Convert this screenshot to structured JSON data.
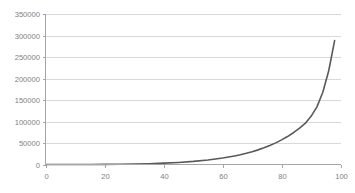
{
  "chart_data": {
    "type": "line",
    "title": "",
    "subtitle": "",
    "xlabel": "",
    "ylabel": "",
    "xlim": [
      0,
      100
    ],
    "ylim": [
      0,
      350000
    ],
    "grid": "horizontal",
    "legend": "none",
    "x_ticks": [
      0,
      20,
      40,
      60,
      80,
      100
    ],
    "x_tick_labels": [
      "0",
      "20",
      "40",
      "60",
      "80",
      "100"
    ],
    "y_ticks": [
      0,
      50000,
      100000,
      150000,
      200000,
      250000,
      300000,
      350000
    ],
    "y_tick_labels": [
      "0",
      "50000",
      "100000",
      "150000",
      "200000",
      "250000",
      "300000",
      "350000"
    ],
    "series": [
      {
        "name": "",
        "color": "#595959",
        "x": [
          0,
          5,
          10,
          15,
          20,
          25,
          30,
          35,
          40,
          45,
          50,
          55,
          60,
          62,
          64,
          66,
          68,
          70,
          72,
          74,
          76,
          78,
          80,
          82,
          84,
          86,
          88,
          90,
          92,
          94,
          96,
          98
        ],
        "values": [
          0,
          20,
          60,
          140,
          300,
          600,
          1100,
          1900,
          3100,
          4800,
          7200,
          10500,
          15000,
          17300,
          19900,
          22800,
          26100,
          29800,
          34000,
          38800,
          44200,
          50300,
          57200,
          65000,
          73900,
          84000,
          95500,
          112000,
          134000,
          168000,
          218000,
          288000
        ]
      }
    ]
  },
  "axes": {
    "y_axis_name": "value-axis",
    "x_axis_name": "category-axis"
  }
}
